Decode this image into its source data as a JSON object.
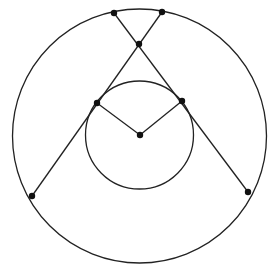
{
  "diagram": {
    "type": "geometry-figure",
    "stroke_color": "#222222",
    "point_color": "#111111",
    "background": "#ffffff",
    "circles": [
      {
        "id": "outer-circle",
        "cx": 139.5,
        "cy": 136,
        "r": 127
      },
      {
        "id": "inner-circle",
        "cx": 139.5,
        "cy": 135,
        "r": 54
      }
    ],
    "points": [
      {
        "id": "top-left",
        "x": 114,
        "y": 13
      },
      {
        "id": "top-right",
        "x": 162,
        "y": 12
      },
      {
        "id": "crossing",
        "x": 139,
        "y": 44
      },
      {
        "id": "inner-left",
        "x": 97,
        "y": 103
      },
      {
        "id": "inner-right",
        "x": 182,
        "y": 101
      },
      {
        "id": "center",
        "x": 140,
        "y": 135
      },
      {
        "id": "outer-bottom-left",
        "x": 32,
        "y": 196
      },
      {
        "id": "outer-bottom-right",
        "x": 248,
        "y": 192
      }
    ],
    "segments": [
      {
        "id": "top-left-to-outer-bottom-right",
        "from": [
          114,
          13
        ],
        "to": [
          248,
          192
        ]
      },
      {
        "id": "top-right-to-outer-bottom-left",
        "from": [
          162,
          12
        ],
        "to": [
          32,
          196
        ]
      },
      {
        "id": "inner-left-to-center",
        "from": [
          97,
          103
        ],
        "to": [
          140,
          135
        ]
      },
      {
        "id": "inner-right-to-center",
        "from": [
          182,
          101
        ],
        "to": [
          140,
          135
        ]
      }
    ]
  }
}
